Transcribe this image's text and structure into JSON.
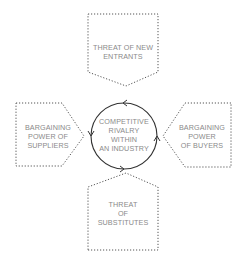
{
  "diagram": {
    "type": "five-forces",
    "colors": {
      "stroke": "#555555",
      "text": "#8a8a8a",
      "circle": "#333333"
    },
    "center": {
      "lines": [
        "COMPETITIVE",
        "RIVALRY",
        "WITHIN",
        "AN INDUSTRY"
      ]
    },
    "top": {
      "lines": [
        "THREAT OF NEW",
        "ENTRANTS"
      ]
    },
    "left": {
      "lines": [
        "BARGAINING",
        "POWER OF",
        "SUPPLIERS"
      ]
    },
    "right": {
      "lines": [
        "BARGAINING",
        "POWER",
        "OF BUYERS"
      ]
    },
    "bottom": {
      "lines": [
        "THREAT",
        "OF",
        "SUBSTITUTES"
      ]
    }
  }
}
